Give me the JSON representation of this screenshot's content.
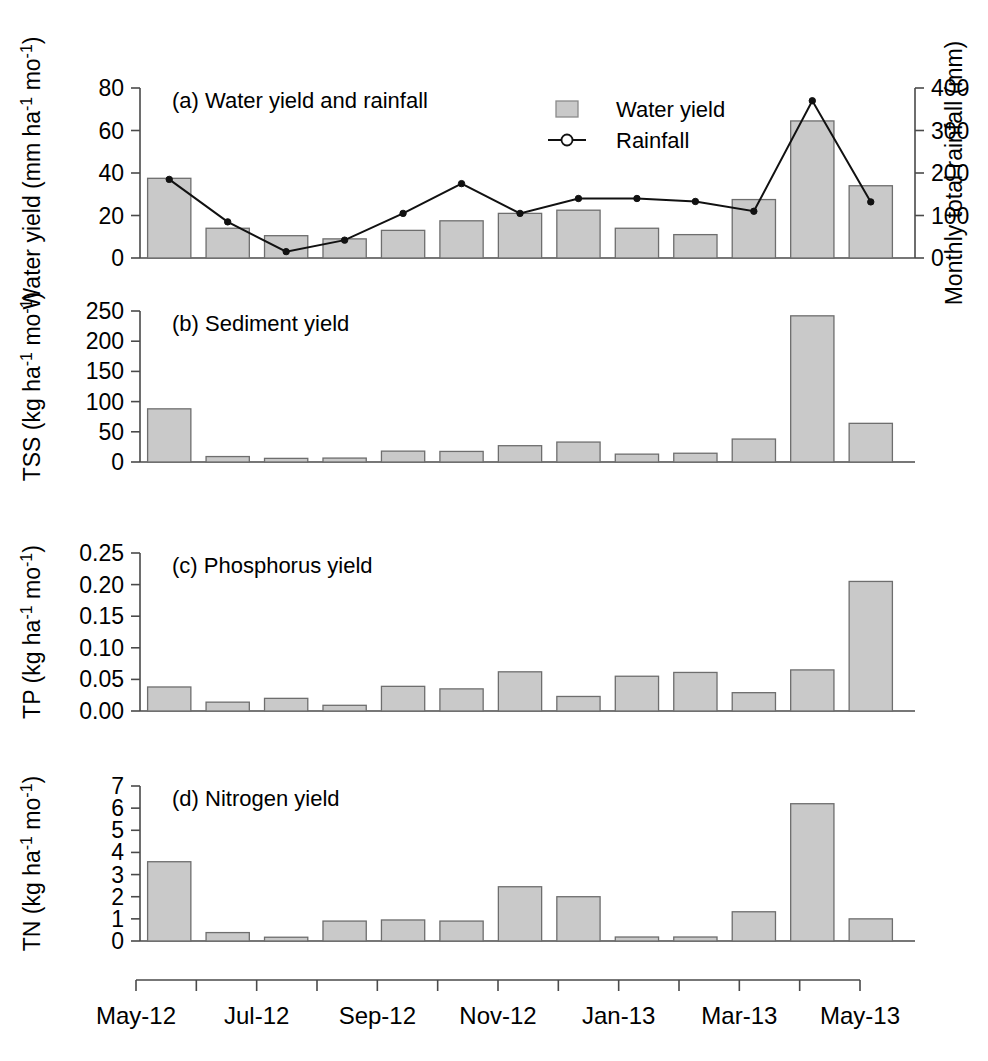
{
  "figure": {
    "background": "#ffffff",
    "bar_fill": "#c9c9c9",
    "bar_stroke": "#6e6e6e",
    "line_color": "#111111",
    "axis_color": "#4a4a4a"
  },
  "x_axis": {
    "categories": [
      "May-12",
      "Jun-12",
      "Jul-12",
      "Aug-12",
      "Sep-12",
      "Oct-12",
      "Nov-12",
      "Dec-12",
      "Jan-13",
      "Feb-13",
      "Mar-13",
      "Apr-13",
      "May-13"
    ],
    "tick_labels": [
      "May-12",
      "Jul-12",
      "Sep-12",
      "Nov-12",
      "Jan-13",
      "Mar-13",
      "May-13"
    ],
    "tick_label_indices": [
      0,
      2,
      4,
      6,
      8,
      10,
      12
    ],
    "n_ticks": 13
  },
  "legend": {
    "position": "panel-a-upper-right",
    "items": [
      {
        "key": "water-yield",
        "label": "Water yield",
        "marker": "filled-square",
        "color": "#c9c9c9"
      },
      {
        "key": "rainfall",
        "label": "Rainfall",
        "marker": "line-open-circle",
        "color": "#111111"
      }
    ]
  },
  "chart_data": [
    {
      "id": "panel-a",
      "type": "bar",
      "title": "(a) Water yield and rainfall",
      "panel_letter": "(a)",
      "ylabel": "Water yield (mm ha⁻¹ mo⁻¹)",
      "ylabel_parts": {
        "pre": "Water yield (mm ha",
        "sup1": "-1",
        "mid": " mo",
        "sup2": "-1",
        "post": ")"
      },
      "y2label": "Monthly total rainfall (mm)",
      "xlabel": "",
      "ylim": [
        0,
        80
      ],
      "yticks": [
        0,
        20,
        40,
        60,
        80
      ],
      "ytick_labels": [
        "0",
        "20",
        "40",
        "60",
        "80"
      ],
      "y2lim": [
        0,
        400
      ],
      "y2ticks": [
        0,
        100,
        200,
        300,
        400
      ],
      "y2tick_labels": [
        "0",
        "100",
        "200",
        "300",
        "400"
      ],
      "grid": false,
      "categories": [
        "May-12",
        "Jun-12",
        "Jul-12",
        "Aug-12",
        "Sep-12",
        "Oct-12",
        "Nov-12",
        "Dec-12",
        "Jan-13",
        "Feb-13",
        "Mar-13",
        "Apr-13",
        "May-13"
      ],
      "series": [
        {
          "name": "Water yield",
          "kind": "bar",
          "axis": "left",
          "values": [
            37.5,
            14.0,
            10.5,
            9.0,
            13.0,
            17.5,
            21.0,
            22.5,
            14.0,
            11.0,
            27.5,
            64.5,
            34.0
          ]
        },
        {
          "name": "Rainfall",
          "kind": "line",
          "axis": "right",
          "values": [
            185,
            85,
            15,
            42,
            105,
            175,
            105,
            140,
            140,
            133,
            110,
            370,
            132
          ]
        }
      ]
    },
    {
      "id": "panel-b",
      "type": "bar",
      "title": "(b) Sediment yield",
      "panel_letter": "(b)",
      "ylabel": "TSS (kg ha⁻¹ mo⁻¹)",
      "ylabel_parts": {
        "pre": "TSS (kg ha",
        "sup1": "-1",
        "mid": " mo",
        "sup2": "-1",
        "post": ")"
      },
      "xlabel": "",
      "ylim": [
        0,
        250
      ],
      "yticks": [
        0,
        50,
        100,
        150,
        200,
        250
      ],
      "ytick_labels": [
        "0",
        "50",
        "100",
        "150",
        "200",
        "250"
      ],
      "grid": false,
      "categories": [
        "May-12",
        "Jun-12",
        "Jul-12",
        "Aug-12",
        "Sep-12",
        "Oct-12",
        "Nov-12",
        "Dec-12",
        "Jan-13",
        "Feb-13",
        "Mar-13",
        "Apr-13",
        "May-13"
      ],
      "series": [
        {
          "name": "TSS",
          "kind": "bar",
          "axis": "left",
          "values": [
            88,
            9,
            6,
            6.5,
            18,
            17.5,
            27,
            33,
            13,
            14.5,
            38,
            242,
            64
          ]
        }
      ]
    },
    {
      "id": "panel-c",
      "type": "bar",
      "title": "(c) Phosphorus yield",
      "panel_letter": "(c)",
      "ylabel": "TP (kg ha⁻¹ mo⁻¹)",
      "ylabel_parts": {
        "pre": "TP (kg ha",
        "sup1": "-1",
        "mid": " mo",
        "sup2": "-1",
        "post": ")"
      },
      "xlabel": "",
      "ylim": [
        0,
        0.25
      ],
      "yticks": [
        0,
        0.05,
        0.1,
        0.15,
        0.2,
        0.25
      ],
      "ytick_labels": [
        "0.00",
        "0.05",
        "0.10",
        "0.15",
        "0.20",
        "0.25"
      ],
      "grid": false,
      "categories": [
        "May-12",
        "Jun-12",
        "Jul-12",
        "Aug-12",
        "Sep-12",
        "Oct-12",
        "Nov-12",
        "Dec-12",
        "Jan-13",
        "Feb-13",
        "Mar-13",
        "Apr-13",
        "May-13"
      ],
      "series": [
        {
          "name": "TP",
          "kind": "bar",
          "axis": "left",
          "values": [
            0.038,
            0.014,
            0.02,
            0.009,
            0.039,
            0.035,
            0.062,
            0.023,
            0.055,
            0.061,
            0.029,
            0.065,
            0.205
          ]
        }
      ]
    },
    {
      "id": "panel-d",
      "type": "bar",
      "title": "(d) Nitrogen yield",
      "panel_letter": "(d)",
      "ylabel": "TN (kg ha⁻¹ mo⁻¹)",
      "ylabel_parts": {
        "pre": "TN (kg ha",
        "sup1": "-1",
        "mid": " mo",
        "sup2": "-1",
        "post": ")"
      },
      "xlabel": "",
      "ylim": [
        0,
        7
      ],
      "yticks": [
        0,
        1,
        2,
        3,
        4,
        5,
        6,
        7
      ],
      "ytick_labels": [
        "0",
        "1",
        "2",
        "3",
        "4",
        "5",
        "6",
        "7"
      ],
      "grid": false,
      "categories": [
        "May-12",
        "Jun-12",
        "Jul-12",
        "Aug-12",
        "Sep-12",
        "Oct-12",
        "Nov-12",
        "Dec-12",
        "Jan-13",
        "Feb-13",
        "Mar-13",
        "Apr-13",
        "May-13"
      ],
      "series": [
        {
          "name": "TN",
          "kind": "bar",
          "axis": "left",
          "values": [
            3.58,
            0.38,
            0.17,
            0.9,
            0.95,
            0.9,
            2.45,
            2.0,
            0.18,
            0.18,
            1.32,
            6.2,
            1.0
          ]
        }
      ]
    }
  ]
}
